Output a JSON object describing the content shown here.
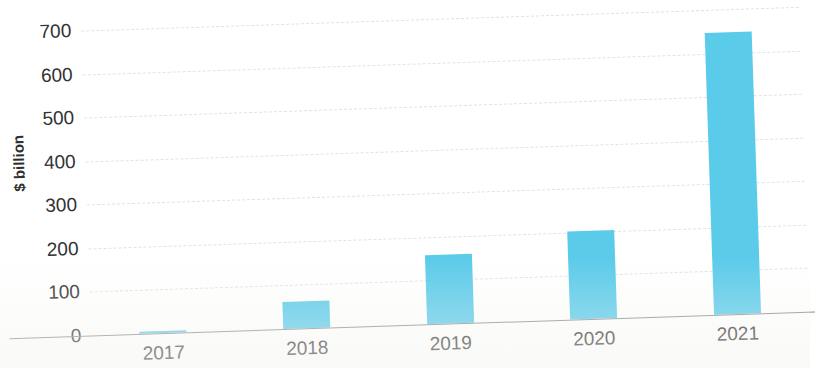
{
  "chart_data": {
    "type": "bar",
    "title": "",
    "subtitle": "",
    "xlabel": "",
    "ylabel": "$ billion",
    "categories": [
      "2017",
      "2018",
      "2019",
      "2020",
      "2021"
    ],
    "values": [
      2,
      62,
      158,
      202,
      648
    ],
    "series": [
      {
        "name": "",
        "values": [
          2,
          62,
          158,
          202,
          648
        ]
      }
    ],
    "ylim": [
      0,
      700
    ],
    "y_ticks": [
      "700",
      "600",
      "500",
      "400",
      "300",
      "200",
      "100",
      "0"
    ],
    "y_tick_values": [
      700,
      600,
      500,
      400,
      300,
      200,
      100,
      0
    ],
    "grid": "horizontal-dashed",
    "legend": "none",
    "bar_color": "#5bcbea",
    "text_color": "#333333",
    "gridline_color": "#e2e2e2",
    "axis_color": "#8c8c8c",
    "background_color": "#ffffff"
  }
}
